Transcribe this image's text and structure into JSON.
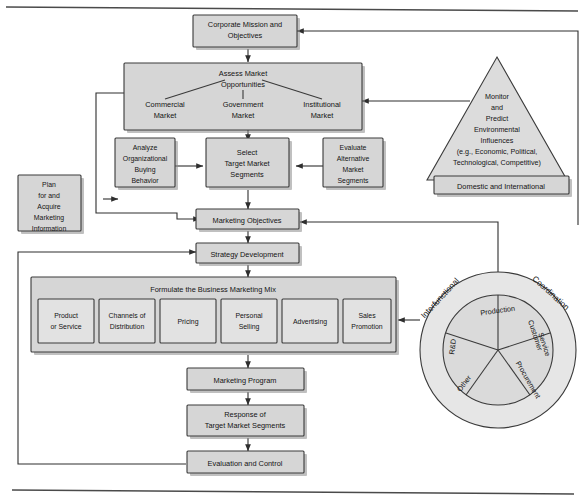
{
  "diagram": {
    "nodes": {
      "corporate_mission": [
        "Corporate Mission and",
        "Objectives"
      ],
      "assess_header": [
        "Assess Market",
        "Opportunities"
      ],
      "commercial_market": [
        "Commercial",
        "Market"
      ],
      "government_market": [
        "Government",
        "Market"
      ],
      "institutional_market": [
        "Institutional",
        "Market"
      ],
      "analyze_buying": [
        "Analyze",
        "Organizational",
        "Buying",
        "Behavior"
      ],
      "select_target": [
        "Select",
        "Target Market",
        "Segments"
      ],
      "evaluate_alt": [
        "Evaluate",
        "Alternative",
        "Market",
        "Segments"
      ],
      "plan_acquire": [
        "Plan",
        "for and",
        "Acquire",
        "Marketing",
        "Information"
      ],
      "marketing_objectives": [
        "Marketing Objectives"
      ],
      "strategy_development": [
        "Strategy Development"
      ],
      "mix_header": [
        "Formulate the Business Marketing Mix"
      ],
      "marketing_program": [
        "Marketing Program"
      ],
      "response_target": [
        "Response of",
        "Target Market Segments"
      ],
      "evaluation_control": [
        "Evaluation and Control"
      ],
      "triangle": [
        "Monitor",
        "and",
        "Predict",
        "Environmental",
        "Influences",
        "(e.g., Economic, Political,",
        "Technological, Competitive)"
      ],
      "domestic_international": [
        "Domestic and International"
      ]
    },
    "mix_elements": [
      [
        "Product",
        "or Service"
      ],
      [
        "Channels of",
        "Distribution"
      ],
      [
        "Pricing"
      ],
      [
        "Personal",
        "Selling"
      ],
      [
        "Advertising"
      ],
      [
        "Sales",
        "Promotion"
      ]
    ],
    "wheel": {
      "ring_label_left": "Interfunctional",
      "ring_label_right": "Coordination",
      "segments": [
        "Production",
        "Customer Service",
        "Procurement",
        "Other",
        "R&D"
      ],
      "segment_labels": {
        "production": "Production",
        "customer": [
          "Customer",
          "Service"
        ],
        "procurement": "Procurement",
        "other": "Other",
        "rd": "R&D"
      }
    },
    "colors": {
      "box_fill": "#d6d6d6",
      "box_stroke": "#3a3a3a",
      "ring_fill": "#e6e6e6",
      "line": "#2e2e2e",
      "page": "#ffffff"
    }
  }
}
